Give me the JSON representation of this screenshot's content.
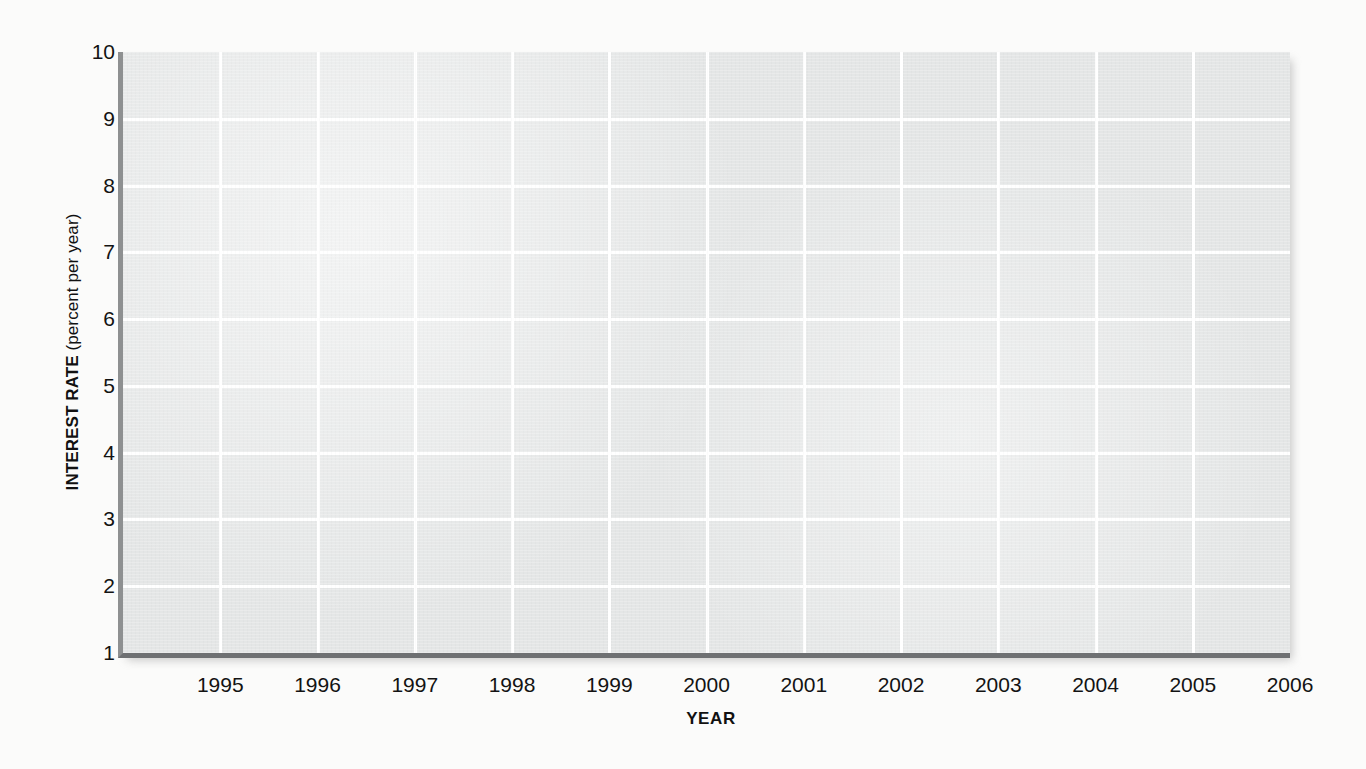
{
  "chart_data": {
    "type": "line",
    "title": "",
    "subtitle": "",
    "xlabel": "YEAR",
    "ylabel_bold": "INTEREST RATE",
    "ylabel_unit": "(percent per year)",
    "ylabel_full": "INTEREST RATE (percent per year)",
    "x": [
      1995,
      1996,
      1997,
      1998,
      1999,
      2000,
      2001,
      2002,
      2003,
      2004,
      2005,
      2006
    ],
    "xtick_labels": [
      "1995",
      "1996",
      "1997",
      "1998",
      "1999",
      "2000",
      "2001",
      "2002",
      "2003",
      "2004",
      "2005",
      "2006"
    ],
    "ytick_labels": [
      "10",
      "9",
      "8",
      "7",
      "6",
      "5",
      "4",
      "3",
      "2",
      "1"
    ],
    "ytick_values": [
      10,
      9,
      8,
      7,
      6,
      5,
      4,
      3,
      2,
      1
    ],
    "ylim": [
      1,
      10
    ],
    "xlim": [
      1994,
      2006
    ],
    "grid": true,
    "grid_color": "#ffffff",
    "plot_bg_color": "#e4e6e6",
    "page_bg_color": "#fbfbfa",
    "axis_color": "#8e9091",
    "legend": [],
    "series": [],
    "annotations": [],
    "note": "blank plotting grid — no data series drawn"
  },
  "figure": {
    "xlabel": "YEAR",
    "ylabel_bold": "INTEREST RATE",
    "ylabel_unit": " (percent per year)"
  }
}
